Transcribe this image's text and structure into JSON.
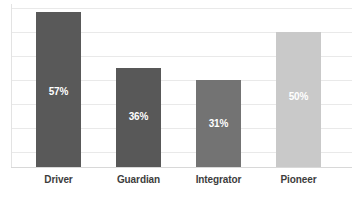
{
  "chart_data": {
    "type": "bar",
    "title": "",
    "subtitle": "",
    "xlabel": "",
    "ylabel": "",
    "categories": [
      "Driver",
      "Guardian",
      "Integrator",
      "Pioneer"
    ],
    "values": [
      57,
      36,
      31,
      50
    ],
    "value_labels": [
      "57%",
      "36%",
      "31%",
      "50%"
    ],
    "unit": "%",
    "ylim": [
      0,
      84
    ],
    "gridlines": [
      12,
      24,
      36,
      48,
      60,
      72,
      84
    ],
    "grid": true,
    "legend": "none",
    "bar_colors": [
      "#595959",
      "#585858",
      "#737373",
      "#c9c9c9"
    ],
    "data_label_color": "#ffffff",
    "category_label_color": "#3d3d3d",
    "gridline_color": "#e9e9e9",
    "axis_color": "#d8d8d8",
    "background_color": "#ffffff",
    "bars": [
      {
        "category": "Driver",
        "value": 57,
        "value_label": "57%",
        "color": "#595959",
        "x": 36,
        "width": 45,
        "top": 12,
        "height": 155,
        "label_y": 86
      },
      {
        "category": "Guardian",
        "value": 36,
        "value_label": "36%",
        "color": "#585858",
        "x": 116,
        "width": 45,
        "top": 68,
        "height": 99,
        "label_y": 111
      },
      {
        "category": "Integrator",
        "value": 31,
        "value_label": "31%",
        "color": "#737373",
        "x": 196,
        "width": 45,
        "top": 80,
        "height": 87,
        "label_y": 118
      },
      {
        "category": "Pioneer",
        "value": 50,
        "value_label": "50%",
        "color": "#c9c9c9",
        "x": 276,
        "width": 45,
        "top": 32,
        "height": 135,
        "label_y": 91
      }
    ]
  }
}
